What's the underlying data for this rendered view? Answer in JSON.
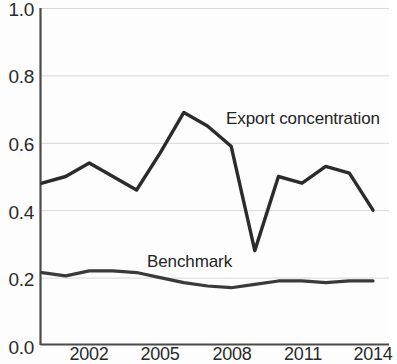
{
  "chart_data": {
    "type": "line",
    "title": "",
    "subtitle": "",
    "xlabel": "",
    "ylabel": "",
    "xlim": [
      2000,
      2014
    ],
    "ylim": [
      0.0,
      1.0
    ],
    "grid": true,
    "grid_axis": "y",
    "legend_position": "inline-annotation",
    "x": [
      2000,
      2001,
      2002,
      2003,
      2004,
      2005,
      2006,
      2007,
      2008,
      2009,
      2010,
      2011,
      2012,
      2013,
      2014
    ],
    "xticks": [
      2002,
      2005,
      2008,
      2011,
      2014
    ],
    "xtick_labels": [
      "2002",
      "2005",
      "2008",
      "2011",
      "2014"
    ],
    "yticks": [
      0.0,
      0.2,
      0.4,
      0.6,
      0.8,
      1.0
    ],
    "ytick_labels": [
      "0.0",
      "0.2",
      "0.4",
      "0.6",
      "0.8",
      "1.0"
    ],
    "series": [
      {
        "name": "Export concentration",
        "color": "#2b2b2b",
        "values": [
          0.48,
          0.5,
          0.54,
          0.5,
          0.46,
          0.57,
          0.69,
          0.65,
          0.59,
          0.28,
          0.5,
          0.48,
          0.53,
          0.51,
          0.4
        ]
      },
      {
        "name": "Benchmark",
        "color": "#3a3a3a",
        "values": [
          0.215,
          0.205,
          0.22,
          0.22,
          0.215,
          0.2,
          0.185,
          0.175,
          0.17,
          0.18,
          0.19,
          0.19,
          0.185,
          0.19,
          0.19
        ]
      }
    ],
    "annotations": [
      {
        "text": "Export concentration",
        "series": "Export concentration",
        "x": 2010.8,
        "y": 0.685
      },
      {
        "text": "Benchmark",
        "series": "Benchmark",
        "x": 2004.5,
        "y": 0.245
      }
    ]
  },
  "axes": {
    "y_labels": [
      "1.0",
      "0.8",
      "0.6",
      "0.4",
      "0.2",
      "0.0"
    ],
    "x_labels": [
      "2002",
      "2005",
      "2008",
      "2011",
      "2014"
    ]
  },
  "labels": {
    "export_concentration": "Export concentration",
    "benchmark": "Benchmark"
  },
  "colors": {
    "line": "#2b2b2b",
    "axis": "#4a4a4a",
    "grid": "#d8d8d8",
    "background": "#fdfdfd",
    "text": "#2a2a2a"
  }
}
